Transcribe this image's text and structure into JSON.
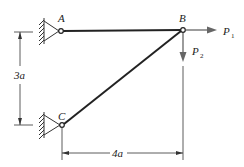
{
  "diagram": {
    "type": "truss",
    "nodes": {
      "A": {
        "label": "A",
        "support": "pin-wall"
      },
      "B": {
        "label": "B",
        "support": "free"
      },
      "C": {
        "label": "C",
        "support": "pin-wall"
      }
    },
    "members": [
      {
        "from": "A",
        "to": "B"
      },
      {
        "from": "C",
        "to": "B"
      }
    ],
    "loads": [
      {
        "at": "B",
        "name": "P",
        "subscript": "1",
        "direction": "right"
      },
      {
        "at": "B",
        "name": "P",
        "subscript": "2",
        "direction": "down"
      }
    ],
    "dimensions": {
      "vertical": {
        "value": "3",
        "unit": "a",
        "text": "3a"
      },
      "horizontal": {
        "value": "4",
        "unit": "a",
        "text": "4a"
      }
    },
    "colors": {
      "line": "#222222",
      "load": "#666666",
      "dim": "#333333"
    }
  }
}
